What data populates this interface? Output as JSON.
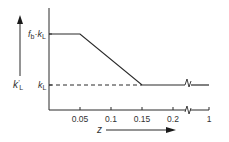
{
  "chart_data": {
    "type": "line",
    "title": "",
    "xlabel": "z",
    "ylabel": "k'L",
    "x_ticks": [
      "0.05",
      "0.1",
      "0.15",
      "0.2",
      "1"
    ],
    "x_tick_values": [
      0.05,
      0.1,
      0.15,
      0.2,
      1
    ],
    "axis_break_between": [
      0.2,
      1
    ],
    "y_tick_labels": [
      {
        "label": "fb·kL",
        "value": "fb·kL"
      },
      {
        "label": "kL",
        "value": "kL"
      }
    ],
    "series": [
      {
        "name": "k'L (solid)",
        "style": "solid",
        "points": [
          {
            "x": 0,
            "y": "fb·kL"
          },
          {
            "x": 0.05,
            "y": "fb·kL"
          },
          {
            "x": 0.15,
            "y": "kL"
          },
          {
            "x": 1,
            "y": "kL"
          }
        ]
      },
      {
        "name": "kL reference (dashed)",
        "style": "dashed",
        "points": [
          {
            "x": 0,
            "y": "kL"
          },
          {
            "x": 0.15,
            "y": "kL"
          }
        ]
      }
    ],
    "grid": false,
    "legend": "none"
  },
  "labels": {
    "y_axis_symbol": "k",
    "y_axis_prime": "'",
    "y_axis_sub": "L",
    "upper_f": "f",
    "upper_f_sub": "b",
    "upper_dot": "·",
    "upper_k": "k",
    "upper_k_sub": "L",
    "lower_k": "k",
    "lower_k_sub": "L",
    "x_axis_symbol": "z"
  },
  "colors": {
    "line": "#2a2a2a",
    "text": "#333333"
  }
}
